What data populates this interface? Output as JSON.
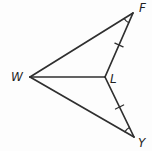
{
  "diagram": {
    "type": "geometry-figure",
    "labels": {
      "W": "W",
      "F": "F",
      "L": "L",
      "Y": "Y"
    },
    "segments": [
      "WF",
      "WL",
      "WY",
      "FL",
      "LY"
    ],
    "congruence_marks": {
      "tick_FL": "single tick on segment FL",
      "tick_LY": "single tick on segment LY",
      "angle_arc_F": "single arc at angle F",
      "angle_arc_Y": "single arc at angle Y"
    },
    "colors": {
      "line": "#2f2f2f",
      "label": "#1f1f1f"
    }
  }
}
